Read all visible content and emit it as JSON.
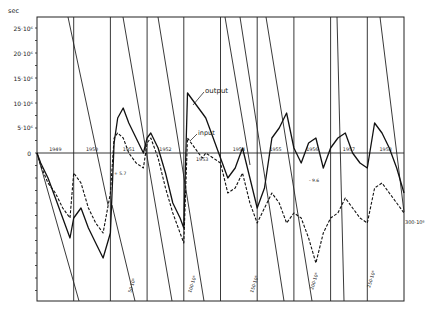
{
  "chart_data": {
    "type": "line",
    "title": "",
    "ylabel": "sec",
    "xlabel": "",
    "ylim": [
      -43000000,
      27000000
    ],
    "y_ticks": [
      {
        "value": 25000000,
        "label": "25·10⁶"
      },
      {
        "value": 20000000,
        "label": "20·10⁶"
      },
      {
        "value": 15000000,
        "label": "15·10⁶"
      },
      {
        "value": 10000000,
        "label": "10·10⁶"
      },
      {
        "value": 5000000,
        "label": "5·10⁶"
      },
      {
        "value": 0,
        "label": "0"
      }
    ],
    "categories": [
      "1949",
      "1950",
      "1951",
      "1952",
      "1953",
      "1954",
      "1955",
      "1956",
      "1957",
      "1958"
    ],
    "grid": true,
    "legend": "inline",
    "annotations": [
      {
        "text": "output",
        "x": 1952.6,
        "y": 9500000
      },
      {
        "text": "input",
        "x": 1952.6,
        "y": 4000000
      },
      {
        "text": "300·10⁶",
        "x": 1958.95,
        "y": -14500000
      }
    ],
    "diagonal_labels": [
      "50·10⁶",
      "100·10⁶",
      "150·10⁶",
      "200·10⁶",
      "250·10⁶"
    ],
    "series": [
      {
        "name": "output",
        "style": "solid",
        "x": [
          1949.0,
          1949.1,
          1949.3,
          1949.5,
          1949.7,
          1949.9,
          1950.0,
          1950.2,
          1950.4,
          1950.6,
          1950.8,
          1951.0,
          1951.1,
          1951.2,
          1951.35,
          1951.5,
          1951.7,
          1951.9,
          1952.0,
          1952.1,
          1952.3,
          1952.5,
          1952.7,
          1952.9,
          1953.0,
          1953.1,
          1953.3,
          1953.5,
          1953.6,
          1953.8,
          1954.0,
          1954.2,
          1954.4,
          1954.6,
          1954.8,
          1955.0,
          1955.2,
          1955.4,
          1955.6,
          1955.8,
          1956.0,
          1956.2,
          1956.4,
          1956.6,
          1956.8,
          1957.0,
          1957.2,
          1957.4,
          1957.6,
          1957.8,
          1958.0,
          1958.2,
          1958.4,
          1958.6,
          1958.8,
          1959.0
        ],
        "values": [
          0,
          -2000000,
          -5000000,
          -9000000,
          -13000000,
          -17000000,
          -13000000,
          -11000000,
          -15000000,
          -18000000,
          -21000000,
          -16000000,
          2000000,
          7000000,
          9000000,
          6000000,
          3000000,
          0,
          3000000,
          4000000,
          1000000,
          -4000000,
          -10000000,
          -13000000,
          -15000000,
          12000000,
          10000000,
          8000000,
          7000000,
          3000000,
          -1000000,
          -5000000,
          -3000000,
          1000000,
          -5000000,
          -11000000,
          -7000000,
          3000000,
          5000000,
          8000000,
          1000000,
          -2000000,
          2000000,
          3000000,
          -3000000,
          1000000,
          3000000,
          4000000,
          0,
          -2000000,
          -3000000,
          6000000,
          4000000,
          1000000,
          -3000000,
          -8000000
        ]
      },
      {
        "name": "input",
        "style": "dashed",
        "x": [
          1949.0,
          1949.1,
          1949.3,
          1949.5,
          1949.7,
          1949.9,
          1950.0,
          1950.2,
          1950.4,
          1950.6,
          1950.8,
          1951.0,
          1951.1,
          1951.2,
          1951.35,
          1951.5,
          1951.7,
          1951.9,
          1952.0,
          1952.1,
          1952.3,
          1952.5,
          1952.7,
          1952.9,
          1953.0,
          1953.1,
          1953.3,
          1953.5,
          1953.6,
          1953.8,
          1954.0,
          1954.2,
          1954.4,
          1954.6,
          1954.8,
          1955.0,
          1955.2,
          1955.4,
          1955.6,
          1955.8,
          1956.0,
          1956.2,
          1956.4,
          1956.6,
          1956.8,
          1957.0,
          1957.2,
          1957.4,
          1957.6,
          1957.8,
          1958.0,
          1958.2,
          1958.4,
          1958.6,
          1958.8,
          1959.0
        ],
        "values": [
          0,
          -2500000,
          -6000000,
          -8000000,
          -11000000,
          -13000000,
          -4000000,
          -6000000,
          -11000000,
          -14000000,
          -16000000,
          -8000000,
          3000000,
          4000000,
          3000000,
          0,
          -2000000,
          -3000000,
          2000000,
          3000000,
          -1000000,
          -7000000,
          -12000000,
          -16000000,
          -18000000,
          3000000,
          1000000,
          -1000000,
          0,
          -1000000,
          -2000000,
          -8000000,
          -7000000,
          -4000000,
          -10000000,
          -14000000,
          -11000000,
          -8000000,
          -10000000,
          -14000000,
          -12000000,
          -13000000,
          -17000000,
          -22000000,
          -16000000,
          -13000000,
          -12000000,
          -9000000,
          -11000000,
          -13000000,
          -14000000,
          -7000000,
          -6000000,
          -8000000,
          -10000000,
          -12000000
        ]
      }
    ]
  },
  "axis": {
    "unit_label": "sec",
    "zero_label": "0",
    "ticks": [
      "25·10⁶",
      "20·10⁶",
      "15·10⁶",
      "10·10⁶",
      "5·10⁶"
    ]
  },
  "years": [
    "1949",
    "1950",
    "1951",
    "1952",
    "1953",
    "1954",
    "1955",
    "1956",
    "1957",
    "1958"
  ],
  "labels": {
    "output": "output",
    "input": "input",
    "end_label": "300·10⁶",
    "small_1": "+ 5.7",
    "small_2": "- 9.6"
  },
  "diagonals": [
    "50·10⁶",
    "100·10⁶",
    "150·10⁶",
    "200·10⁶",
    "250·10⁶"
  ]
}
